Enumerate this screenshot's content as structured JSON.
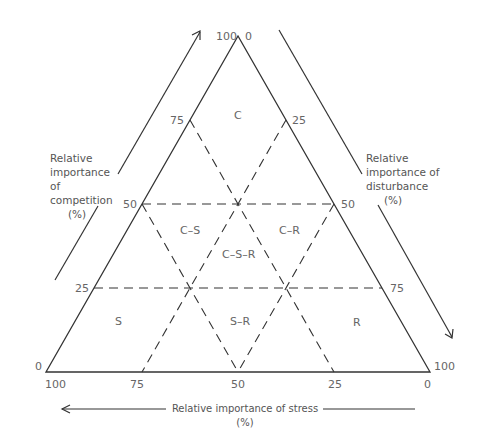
{
  "diagram": {
    "type": "ternary-triangle",
    "vertices": {
      "top": {
        "left_label": "100",
        "right_label": "0"
      },
      "bottom_left": {
        "label": "0",
        "below_label": "100"
      },
      "bottom_right": {
        "label": "100",
        "below_label": "0"
      }
    },
    "left_edge_ticks": [
      "75",
      "50",
      "25"
    ],
    "right_edge_ticks": [
      "25",
      "50",
      "75"
    ],
    "base_ticks": [
      "100",
      "75",
      "50",
      "25",
      "0"
    ],
    "regions": {
      "c": "C",
      "cs": "C–S",
      "cr": "C–R",
      "csr": "C–S–R",
      "s": "S",
      "sr": "S–R",
      "r": "R"
    },
    "axes": {
      "competition": {
        "line1": "Relative",
        "line2": "importance of",
        "line3": "competition",
        "line4": "(%)"
      },
      "disturbance": {
        "line1": "Relative",
        "line2": "importance of",
        "line3": "disturbance",
        "line4": "(%)"
      },
      "stress": {
        "label": "Relative importance of stress (%)"
      }
    },
    "colors": {
      "line": "#333333",
      "text": "#666666"
    }
  }
}
